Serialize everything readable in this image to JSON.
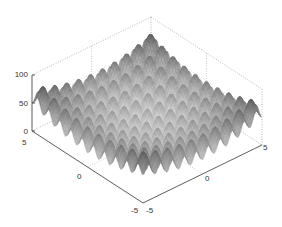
{
  "chart_data": {
    "type": "surface3d",
    "title": "",
    "function": "Rastrigin: z = 20 + x^2 + y^2 - 10(cos(2*pi*x) + cos(2*pi*y))",
    "xlabel": "",
    "ylabel": "",
    "zlabel": "",
    "xlim": [
      -5,
      5
    ],
    "ylim": [
      -5,
      5
    ],
    "zlim": [
      0,
      100
    ],
    "x_ticks": [
      "5",
      "0",
      "-5"
    ],
    "y_ticks": [
      "-5",
      "0",
      "5"
    ],
    "z_ticks": [
      "100",
      "50",
      "0"
    ],
    "colormap": "gray",
    "grid": true,
    "view": "isometric, azimuth -45"
  },
  "axes": {
    "z_tick_labels": [
      "100",
      "50",
      "0"
    ],
    "left_tick_labels": [
      "5",
      "0",
      "-5"
    ],
    "right_tick_labels": [
      "-5",
      "0",
      "5"
    ]
  }
}
